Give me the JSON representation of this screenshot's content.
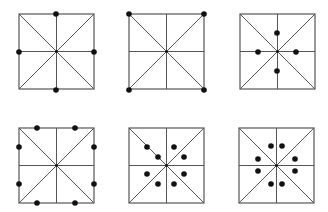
{
  "diagram": {
    "colors": {
      "line": "#555555",
      "dot": "#111111",
      "background": "#ffffff"
    },
    "squares": [
      {
        "id": "sq1",
        "x": 19,
        "y": 14,
        "size": 75,
        "dots": [
          [
            56,
            14
          ],
          [
            19,
            52
          ],
          [
            94,
            52
          ],
          [
            56,
            90
          ]
        ]
      },
      {
        "id": "sq2",
        "x": 129,
        "y": 14,
        "size": 75,
        "dots": [
          [
            129,
            14
          ],
          [
            204,
            14
          ],
          [
            129,
            90
          ],
          [
            204,
            90
          ]
        ]
      },
      {
        "id": "sq3",
        "x": 240,
        "y": 14,
        "size": 75,
        "dots": [
          [
            277,
            33
          ],
          [
            258,
            52
          ],
          [
            296,
            52
          ],
          [
            277,
            71
          ]
        ]
      },
      {
        "id": "sq4",
        "x": 19,
        "y": 128,
        "size": 75,
        "dots": [
          [
            37,
            128
          ],
          [
            75,
            128
          ],
          [
            19,
            147
          ],
          [
            94,
            147
          ],
          [
            19,
            184
          ],
          [
            94,
            184
          ],
          [
            37,
            203
          ],
          [
            75,
            203
          ]
        ]
      },
      {
        "id": "sq5",
        "x": 129,
        "y": 128,
        "size": 75,
        "dots": [
          [
            147,
            147
          ],
          [
            158,
            157
          ],
          [
            174,
            147
          ],
          [
            184,
            157
          ],
          [
            147,
            174
          ],
          [
            158,
            184
          ],
          [
            174,
            184
          ],
          [
            184,
            174
          ]
        ]
      },
      {
        "id": "sq6",
        "x": 239,
        "y": 128,
        "size": 75,
        "dots": [
          [
            271,
            146
          ],
          [
            282,
            146
          ],
          [
            258,
            159
          ],
          [
            295,
            159
          ],
          [
            258,
            171
          ],
          [
            295,
            171
          ],
          [
            271,
            184
          ],
          [
            282,
            184
          ]
        ]
      }
    ]
  }
}
